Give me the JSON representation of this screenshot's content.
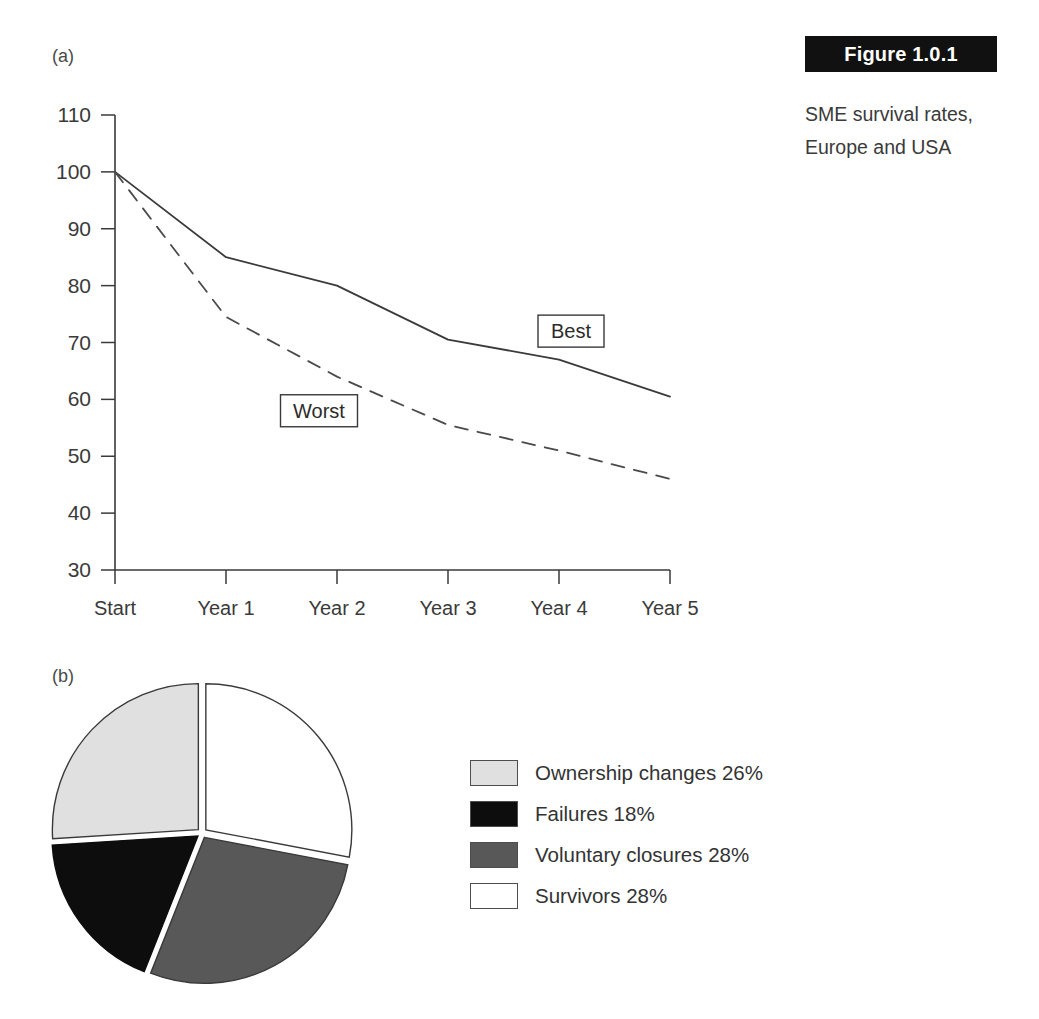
{
  "figure": {
    "tag": "Figure 1.0.1",
    "caption_line1": "SME survival rates,",
    "caption_line2": "Europe and USA"
  },
  "panels": {
    "a_label": "(a)",
    "b_label": "(b)"
  },
  "chart_data": [
    {
      "id": "survival-line-chart",
      "type": "line",
      "title": "SME survival rates, Europe and USA",
      "xlabel": "",
      "ylabel": "",
      "categories": [
        "Start",
        "Year 1",
        "Year 2",
        "Year 3",
        "Year 4",
        "Year 5"
      ],
      "yticks": [
        110,
        100,
        90,
        80,
        70,
        60,
        50,
        40,
        30
      ],
      "ylim": [
        30,
        110
      ],
      "grid": false,
      "legend_position": "inline-labels",
      "series": [
        {
          "name": "Best",
          "style": "solid",
          "color": "#3a3a3a",
          "values": [
            100,
            85,
            80,
            70.5,
            67,
            60.5
          ]
        },
        {
          "name": "Worst",
          "style": "dashed",
          "color": "#4a4a4a",
          "values": [
            100,
            74.5,
            64,
            55.5,
            51,
            46
          ]
        }
      ],
      "annotations": [
        {
          "text": "Best",
          "x": "Year 4",
          "y": 72
        },
        {
          "text": "Worst",
          "x": "Year 2",
          "y": 58
        }
      ]
    },
    {
      "id": "business-outcomes-pie",
      "type": "pie",
      "title": "",
      "exploded": true,
      "start_angle_deg": 0,
      "labels": [
        "Survivors",
        "Voluntary closures",
        "Failures",
        "Ownership changes"
      ],
      "values": [
        28,
        28,
        18,
        26
      ],
      "slices": [
        {
          "label": "Survivors",
          "value": 28,
          "percent_text": "28%",
          "color": "#ffffff",
          "stroke": "#3a3a3a"
        },
        {
          "label": "Voluntary closures",
          "value": 28,
          "percent_text": "28%",
          "color": "#585858",
          "stroke": "#3a3a3a"
        },
        {
          "label": "Failures",
          "value": 18,
          "percent_text": "18%",
          "color": "#0d0d0d",
          "stroke": "#0d0d0d"
        },
        {
          "label": "Ownership changes",
          "value": 26,
          "percent_text": "26%",
          "color": "#e0e0e0",
          "stroke": "#3a3a3a"
        }
      ]
    }
  ],
  "pie_legend": {
    "items": [
      {
        "label": "Ownership changes 26%",
        "color": "#e0e0e0"
      },
      {
        "label": "Failures 18%",
        "color": "#0d0d0d"
      },
      {
        "label": "Voluntary closures 28%",
        "color": "#585858"
      },
      {
        "label": "Survivors 28%",
        "color": "#ffffff"
      }
    ]
  },
  "axis": {
    "y_labels": [
      "110",
      "100",
      "90",
      "80",
      "70",
      "60",
      "50",
      "40",
      "30"
    ],
    "x_labels": [
      "Start",
      "Year 1",
      "Year 2",
      "Year 3",
      "Year 4",
      "Year 5"
    ]
  }
}
